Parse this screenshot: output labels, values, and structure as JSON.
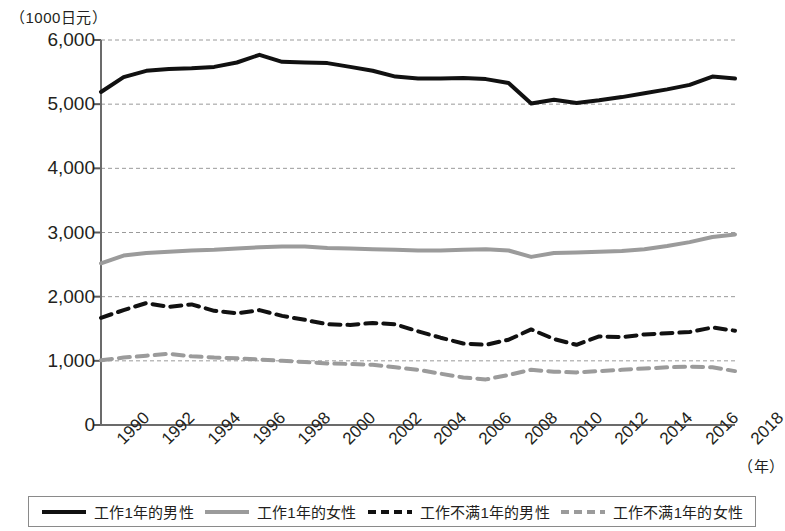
{
  "chart_data": {
    "type": "line",
    "title": "",
    "unit_note": "（1000日元）",
    "xlabel": "（年）",
    "ylabel": "",
    "ylim": [
      0,
      6000
    ],
    "ytick_step": 1000,
    "ytick_labels": [
      "6,000",
      "5,000",
      "4,000",
      "3,000",
      "2,000",
      "1,000",
      "0"
    ],
    "ytick_values": [
      6000,
      5000,
      4000,
      3000,
      2000,
      1000,
      0
    ],
    "grid": true,
    "grid_style": "dotted-horizontal",
    "legend_position": "bottom",
    "x": [
      1990,
      1991,
      1992,
      1993,
      1994,
      1995,
      1996,
      1997,
      1998,
      1999,
      2000,
      2001,
      2002,
      2003,
      2004,
      2005,
      2006,
      2007,
      2008,
      2009,
      2010,
      2011,
      2012,
      2013,
      2014,
      2015,
      2016,
      2017,
      2018
    ],
    "xtick_labels": [
      "1990",
      "1992",
      "1994",
      "1996",
      "1998",
      "2000",
      "2002",
      "2004",
      "2006",
      "2008",
      "2010",
      "2012",
      "2014",
      "2016",
      "2018"
    ],
    "xtick_values": [
      1990,
      1992,
      1994,
      1996,
      1998,
      2000,
      2002,
      2004,
      2006,
      2008,
      2010,
      2012,
      2014,
      2016,
      2018
    ],
    "series": [
      {
        "name": "工作1年的男性",
        "color": "#111111",
        "style": "solid",
        "width": 4,
        "values": [
          5190,
          5420,
          5520,
          5550,
          5560,
          5580,
          5650,
          5770,
          5660,
          5650,
          5640,
          5580,
          5520,
          5430,
          5400,
          5400,
          5410,
          5390,
          5330,
          5010,
          5070,
          5020,
          5060,
          5110,
          5170,
          5230,
          5300,
          5430,
          5400
        ]
      },
      {
        "name": "工作1年的女性",
        "color": "#9b9b9b",
        "style": "solid",
        "width": 4,
        "values": [
          2520,
          2640,
          2680,
          2700,
          2720,
          2730,
          2750,
          2770,
          2780,
          2780,
          2760,
          2750,
          2740,
          2730,
          2720,
          2720,
          2730,
          2740,
          2720,
          2620,
          2680,
          2690,
          2700,
          2710,
          2740,
          2790,
          2850,
          2930,
          2970
        ]
      },
      {
        "name": "工作不满1年的男性",
        "color": "#111111",
        "style": "dashed",
        "width": 4,
        "values": [
          1670,
          1790,
          1900,
          1840,
          1880,
          1780,
          1740,
          1790,
          1700,
          1640,
          1570,
          1560,
          1590,
          1570,
          1460,
          1360,
          1270,
          1250,
          1330,
          1490,
          1340,
          1250,
          1380,
          1370,
          1410,
          1430,
          1450,
          1520,
          1470
        ]
      },
      {
        "name": "工作不满1年的女性",
        "color": "#9b9b9b",
        "style": "dashed",
        "width": 4,
        "values": [
          1010,
          1050,
          1080,
          1110,
          1070,
          1050,
          1040,
          1020,
          1000,
          980,
          960,
          950,
          940,
          900,
          860,
          800,
          740,
          710,
          780,
          860,
          830,
          820,
          840,
          860,
          880,
          900,
          910,
          900,
          840
        ]
      }
    ]
  },
  "legend": {
    "items": [
      {
        "label": "工作1年的男性",
        "swatch": "solid-black-line-icon"
      },
      {
        "label": "工作1年的女性",
        "swatch": "solid-gray-line-icon"
      },
      {
        "label": "工作不满1年的男性",
        "swatch": "dashed-black-line-icon"
      },
      {
        "label": "工作不满1年的女性",
        "swatch": "dashed-gray-line-icon"
      }
    ]
  }
}
